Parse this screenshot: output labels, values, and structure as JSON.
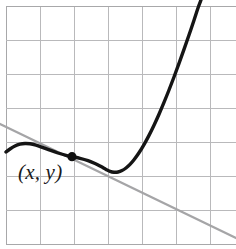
{
  "figure": {
    "background_color": "#ffffff",
    "width": 236,
    "height": 249
  },
  "grid": {
    "line_color": "#b9b9bb",
    "border_color": "#a8a8aa",
    "spacing": 34,
    "x_lines": [
      6,
      40,
      74,
      108,
      142,
      176,
      210
    ],
    "y_lines": [
      6,
      40,
      74,
      108,
      142,
      176,
      210,
      244
    ],
    "columns": 6,
    "rows": 7
  },
  "annotations": {
    "point_label": "(x, y)",
    "point_label_x": 18,
    "point_label_y": 160
  },
  "chart_data": {
    "type": "line",
    "xlabel": "",
    "ylabel": "",
    "grid": true,
    "legend": "none",
    "xlim": [
      6,
      236
    ],
    "ylim": [
      244,
      0
    ],
    "series": [
      {
        "name": "function-curve",
        "color": "#151515",
        "style": "solid",
        "width": 3.4,
        "description": "Cubic-like curve: rises to a local maximum, falls through an inflection point, dips to a local minimum, then rises steeply off the top of the frame.",
        "points": [
          [
            6,
            152
          ],
          [
            10,
            149
          ],
          [
            15,
            146
          ],
          [
            20,
            144.2
          ],
          [
            25,
            143.5
          ],
          [
            30,
            143.8
          ],
          [
            36,
            145.2
          ],
          [
            43,
            147.6
          ],
          [
            50,
            150.2
          ],
          [
            58,
            153.0
          ],
          [
            66,
            155.4
          ],
          [
            72,
            156.7
          ],
          [
            80,
            158.3
          ],
          [
            88,
            160.6
          ],
          [
            95,
            163.5
          ],
          [
            101,
            166.6
          ],
          [
            106,
            169.4
          ],
          [
            110,
            171.3
          ],
          [
            114,
            172.2
          ],
          [
            118,
            172.0
          ],
          [
            122,
            170.6
          ],
          [
            126,
            168.0
          ],
          [
            130,
            164.4
          ],
          [
            134,
            159.8
          ],
          [
            139,
            152.8
          ],
          [
            144,
            144.6
          ],
          [
            149,
            135.4
          ],
          [
            154,
            125.2
          ],
          [
            159,
            114.2
          ],
          [
            164,
            102.4
          ],
          [
            169,
            90.0
          ],
          [
            174,
            77.0
          ],
          [
            179,
            63.4
          ],
          [
            184,
            49.4
          ],
          [
            189,
            35.0
          ],
          [
            194,
            20.2
          ],
          [
            198,
            8.0
          ],
          [
            201,
            0
          ]
        ]
      },
      {
        "name": "tangent-line",
        "color": "#a5a5a7",
        "style": "solid",
        "width": 2.3,
        "description": "Straight line with negative slope drawn tangent to the curve at the marked point (x, y).",
        "points": [
          [
            0,
            124
          ],
          [
            236,
            238
          ]
        ],
        "slope": 0.483
      }
    ],
    "markers": [
      {
        "name": "tangent-point",
        "label": "(x, y)",
        "x": 72,
        "y": 156.7,
        "radius": 4.6,
        "color": "#101010"
      }
    ]
  }
}
